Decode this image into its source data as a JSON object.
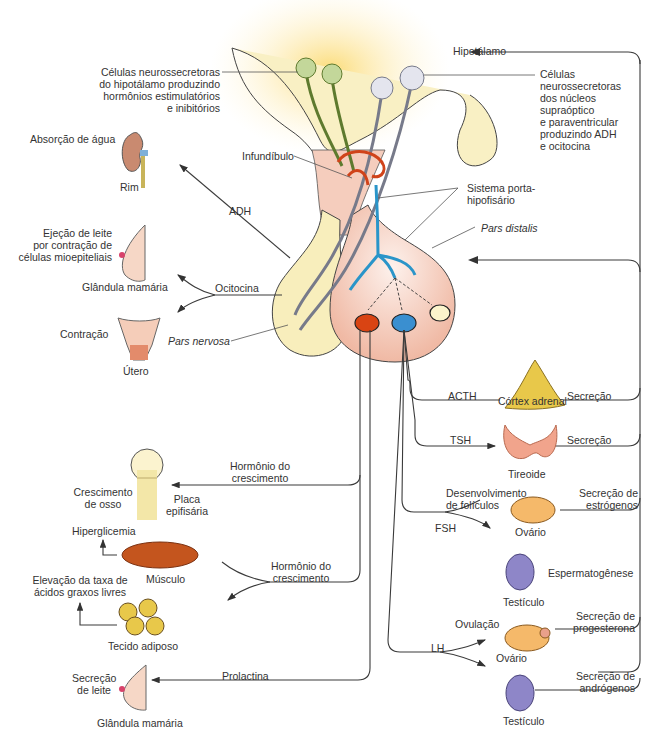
{
  "diagram": {
    "center": {
      "hipotalamo": "Hipotálamo",
      "infundibulo": "Infundíbulo",
      "sistema_porta": "Sistema porta-\nhipofisário",
      "pars_distalis": "Pars distalis",
      "pars_nervosa": "Pars nervosa",
      "cells_left": "Células neurossecretoras\ndo hipotálamo produzindo\nhormônios estimulatórios\ne inibitórios",
      "cells_right": "Células\nneurossecretoras\ndos núcleos\nsupraóptico\ne paraventricular\nproduzindo ADH\ne ocitocina"
    },
    "posterior_targets": {
      "rim_effect": "Absorção de água",
      "rim_label": "Rim",
      "adh": "ADH",
      "mama_effect": "Ejeção de leite\npor contração de\ncélulas mioepiteliais",
      "mama_label": "Glândula mamária",
      "ocitocina": "Ocitocina",
      "utero_effect": "Contração",
      "utero_label": "Útero"
    },
    "anterior_left": {
      "gh1": "Hormônio do\ncrescimento",
      "osso_effect": "Crescimento\nde osso",
      "placa": "Placa\nepifisária",
      "hiperglicemia": "Hiperglicemia",
      "musculo": "Músculo",
      "gh2": "Hormônio do\ncrescimento",
      "acidos": "Elevação da taxa de\nácidos graxos livres",
      "adiposo": "Tecido adiposo",
      "prolactina": "Prolactina",
      "leite_effect": "Secreção\nde leite",
      "mama2_label": "Glândula mamária"
    },
    "anterior_right": {
      "acth": "ACTH",
      "cortex": "Córtex adrenal",
      "secrecao1": "Secreção",
      "tsh": "TSH",
      "tireoide": "Tireoide",
      "secrecao2": "Secreção",
      "foliculos": "Desenvolvimento\nde folículos",
      "estrogenos": "Secreção de\nestrógenos",
      "fsh": "FSH",
      "ovario1": "Ovário",
      "espermato": "Espermatogênese",
      "testiculo1": "Testículo",
      "ovulacao": "Ovulação",
      "progesterona": "Secreção de\nprogesterona",
      "lh": "LH",
      "ovario2": "Ovário",
      "androgenos": "Secreção de\nandrógenos",
      "testiculo2": "Testículo"
    },
    "colors": {
      "posterior_lobe": "#f8eebc",
      "anterior_lobe": "#f5c9b8",
      "glow": "#fde9a0",
      "portal_vessel": "#2a95c9",
      "capillary": "#d0431a",
      "green_neuron": "#9bb86a",
      "grey_neuron": "#c9cad6",
      "line": "#3a3a3a"
    }
  }
}
